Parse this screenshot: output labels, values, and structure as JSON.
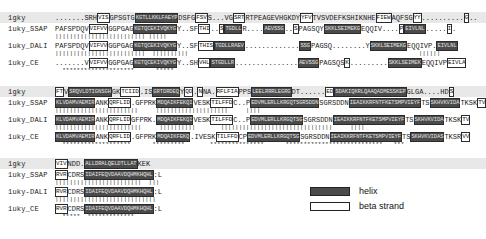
{
  "legend": {
    "items": [
      {
        "key": "helix",
        "label": "helix",
        "color": "#4a4a4a",
        "style": "filled-box"
      },
      {
        "key": "beta-strand",
        "label": "beta strand",
        "color": "#ffffff",
        "style": "outlined-box"
      }
    ]
  },
  "labels": {
    "query": "1gky",
    "ssap": "1uky_SSAP",
    "dali": "1uky_DALI",
    "dali_block3": "1uky-DALI",
    "ce": "1uky_CE"
  },
  "blocks": [
    {
      "id": "block-1",
      "rows": [
        {
          "name": "query-row",
          "label": "1gky",
          "highlight": true,
          "segments": [
            {
              "type": "plain",
              "text": ".......SRH"
            },
            {
              "type": "strand",
              "text": "VIS"
            },
            {
              "type": "plain",
              "text": "GPSGTG"
            },
            {
              "type": "helix",
              "text": "KGTLLKKLFAEYP"
            },
            {
              "type": "plain",
              "text": "DSFG"
            },
            {
              "type": "strand",
              "text": "FSV"
            },
            {
              "type": "plain",
              "text": "S...VG"
            },
            {
              "type": "strand",
              "text": "SRT"
            },
            {
              "type": "plain",
              "text": "RTPEAGEVHGKDY"
            },
            {
              "type": "strand",
              "text": "YFV"
            },
            {
              "type": "plain",
              "text": "TVSVDEFKSHIKNHE"
            },
            {
              "type": "strand",
              "text": "FIEW"
            },
            {
              "type": "plain",
              "text": "AQFSG"
            },
            {
              "type": "strand",
              "text": "YY"
            },
            {
              "type": "plain",
              "text": ".........."
            },
            {
              "type": "strand",
              "text": "G"
            },
            {
              "type": "plain",
              "text": ".."
            }
          ]
        },
        {
          "name": "ssap-row",
          "label": "1uky_SSAP",
          "highlight": false,
          "segments": [
            {
              "type": "plain",
              "text": "PAFSPDQV"
            },
            {
              "type": "strand",
              "text": "VIFVV"
            },
            {
              "type": "plain",
              "text": "GGPGAG"
            },
            {
              "type": "helix",
              "text": "KGTQCEKIVQKYG"
            },
            {
              "type": "plain",
              "text": "Y..SF"
            },
            {
              "type": "strand",
              "text": "THI"
            },
            {
              "type": "plain",
              "text": ".."
            },
            {
              "type": "strand",
              "text": "S"
            },
            {
              "type": "helix",
              "text": "TGDLL"
            },
            {
              "type": "plain",
              "text": "R...."
            },
            {
              "type": "helix",
              "text": "AEVSSG"
            },
            {
              "type": "plain",
              "text": ".."
            },
            {
              "type": "strand",
              "text": "S"
            },
            {
              "type": "plain",
              "text": "PAGSQY"
            },
            {
              "type": "helix",
              "text": "SKKLSEIMEKG"
            },
            {
              "type": "plain",
              "text": "EQQIV...."
            },
            {
              "type": "strand",
              "text": "P"
            },
            {
              "type": "helix",
              "text": "EIVLNL"
            },
            {
              "type": "plain",
              "text": "....."
            },
            {
              "type": "strand",
              "text": "I"
            },
            {
              "type": "plain",
              "text": "."
            }
          ]
        },
        {
          "name": "ssap-dali-marker",
          "marker": "||||||||||||||||||||||||| |||||"
        },
        {
          "name": "dali-row",
          "label": "1uky_DALI",
          "highlight": false,
          "segments": [
            {
              "type": "plain",
              "text": "PAFSPDQV"
            },
            {
              "type": "strand",
              "text": "VIFVV"
            },
            {
              "type": "plain",
              "text": "GGPGAG"
            },
            {
              "type": "helix",
              "text": "KGTQCEKIVQKYG"
            },
            {
              "type": "plain",
              "text": "Y..SF"
            },
            {
              "type": "strand",
              "text": "THIS"
            },
            {
              "type": "helix",
              "text": "TGDLLRAEV"
            },
            {
              "type": "plain",
              "text": "............."
            },
            {
              "type": "helix",
              "text": "SSG"
            },
            {
              "type": "plain",
              "text": "PAGSQ........Y"
            },
            {
              "type": "helix",
              "text": "SKKLSEIMEKG"
            },
            {
              "type": "plain",
              "text": "EQQIVP."
            },
            {
              "type": "helix",
              "text": "EIVLNL"
            }
          ]
        },
        {
          "name": "dali-ce-marker",
          "marker": "|||||||||||||||||||||||||  ||||||||||                                                                ||||||"
        },
        {
          "name": "ce-row",
          "label": "1uky_CE",
          "highlight": false,
          "segments": [
            {
              "type": "plain",
              "text": ".......V"
            },
            {
              "type": "strand",
              "text": "VIFVV"
            },
            {
              "type": "plain",
              "text": "GGPGAG"
            },
            {
              "type": "helix",
              "text": "KGTQCEKIVQKYG"
            },
            {
              "type": "plain",
              "text": "Y..SH"
            },
            {
              "type": "strand",
              "text": "VHL"
            },
            {
              "type": "helix",
              "text": "STGDLLR"
            },
            {
              "type": "plain",
              "text": "..............."
            },
            {
              "type": "helix",
              "text": "AEVSSG"
            },
            {
              "type": "plain",
              "text": "PAGSQS"
            },
            {
              "type": "strand",
              "text": "K"
            },
            {
              "type": "plain",
              "text": "........."
            },
            {
              "type": "helix",
              "text": "SKKLSEIMEK"
            },
            {
              "type": "plain",
              "text": "EQQIVP"
            },
            {
              "type": "strand",
              "text": "EIVLA"
            }
          ]
        },
        {
          "name": "consensus-stars",
          "stars": "  ********************      *****"
        }
      ]
    },
    {
      "id": "block-2",
      "rows": [
        {
          "name": "query-row",
          "label": "1gky",
          "highlight": true,
          "segments": [
            {
              "type": "strand",
              "text": "FT"
            },
            {
              "type": "plain",
              "text": "V"
            },
            {
              "type": "helix",
              "text": "SRQVLDTIGNSGH"
            },
            {
              "type": "plain",
              "text": "GK"
            },
            {
              "type": "strand",
              "text": "TCIID"
            },
            {
              "type": "plain",
              "text": ".IS"
            },
            {
              "type": "helix",
              "text": "GRTDRDEQ"
            },
            {
              "type": "plain",
              "text": "Y"
            },
            {
              "type": "strand",
              "text": "QD"
            },
            {
              "type": "plain",
              "text": "."
            },
            {
              "type": "strand",
              "text": "N"
            },
            {
              "type": "plain",
              "text": "NA."
            },
            {
              "type": "strand",
              "text": "RFLFIA"
            },
            {
              "type": "plain",
              "text": "PPS"
            },
            {
              "type": "helix",
              "text": "LEELRRRLEGRG"
            },
            {
              "type": "plain",
              "text": "DT......"
            },
            {
              "type": "strand",
              "text": "ED"
            },
            {
              "type": "helix",
              "text": "SDAKIQKRLQAAQADMESSKEP"
            },
            {
              "type": "plain",
              "text": "GLGA....HD"
            },
            {
              "type": "strand",
              "text": "S"
            }
          ]
        },
        {
          "name": "ssap-row",
          "label": "1uky_SSAP",
          "highlight": false,
          "segments": [
            {
              "type": "helix",
              "text": "KLVDAMVAEMIR"
            },
            {
              "type": "plain",
              "text": "ANK"
            },
            {
              "type": "strand",
              "text": "QRFLID"
            },
            {
              "type": "plain",
              "text": "."
            },
            {
              "type": "plain",
              "text": "GFPRK"
            },
            {
              "type": "helix",
              "text": "MDQAIKFEKQI"
            },
            {
              "type": "plain",
              "text": "VESK"
            },
            {
              "type": "strand",
              "text": "TILFFD"
            },
            {
              "type": "plain",
              "text": "C..P"
            },
            {
              "type": "helix",
              "text": "EDVMLERLLKRGQTSGRSDDN"
            },
            {
              "type": "plain",
              "text": "SGRSDDN"
            },
            {
              "type": "helix",
              "text": "IEAIKKRFNTFKETSMPVIEYF"
            },
            {
              "type": "plain",
              "text": "TS"
            },
            {
              "type": "helix",
              "text": "SKHVKVIDA"
            },
            {
              "type": "plain",
              "text": "TKSK"
            },
            {
              "type": "strand",
              "text": "TV"
            }
          ]
        },
        {
          "name": "ssap-dali-marker",
          "marker": "|||||||||||||||||||||||     ||||||||||||||||||||     ||||"
        },
        {
          "name": "dali-row",
          "label": "1uky_DALI",
          "highlight": false,
          "segments": [
            {
              "type": "helix",
              "text": "KLVDAMVAEMIR"
            },
            {
              "type": "plain",
              "text": "ANK"
            },
            {
              "type": "strand",
              "text": "QRFLID"
            },
            {
              "type": "plain",
              "text": "GFPRK."
            },
            {
              "type": "helix",
              "text": "MDQAIKFEKQI"
            },
            {
              "type": "plain",
              "text": "VESK"
            },
            {
              "type": "strand",
              "text": "TILFFD"
            },
            {
              "type": "plain",
              "text": "C..P"
            },
            {
              "type": "helix",
              "text": "EDVMLERLLKRGQTSG"
            },
            {
              "type": "plain",
              "text": "SGRSDDN"
            },
            {
              "type": "helix",
              "text": "IEAIKKRFNTFKETSMPVIEYF"
            },
            {
              "type": "plain",
              "text": "TS"
            },
            {
              "type": "helix",
              "text": "SKHVKVIDA"
            },
            {
              "type": "plain",
              "text": "TKSK"
            },
            {
              "type": "strand",
              "text": "TV"
            }
          ]
        },
        {
          "name": "dali-ce-marker",
          "marker": "||||||||||||||||||||||||     ||||||||||       |||||||||||||||||||||||||||||||     ||||"
        },
        {
          "name": "ce-row",
          "label": "1uky_CE",
          "highlight": false,
          "segments": [
            {
              "type": "helix",
              "text": "KLVDAMVAEMIR"
            },
            {
              "type": "plain",
              "text": "ANK"
            },
            {
              "type": "strand",
              "text": "QRFLID"
            },
            {
              "type": "plain",
              "text": ".GFPRK"
            },
            {
              "type": "helix",
              "text": "MDQAIKFEKQ"
            },
            {
              "type": "plain",
              "text": ".IVESK"
            },
            {
              "type": "strand",
              "text": "TILFFD"
            },
            {
              "type": "plain",
              "text": "CP"
            },
            {
              "type": "helix",
              "text": "EDVMLERLLKRGQTSG"
            },
            {
              "type": "plain",
              "text": "SGRSDDN"
            },
            {
              "type": "helix",
              "text": "IEAIKKRFNTFKETSMPVIEYF"
            },
            {
              "type": "plain",
              "text": "TS"
            },
            {
              "type": "helix",
              "text": "SKHVKVIDAS"
            },
            {
              "type": "plain",
              "text": "TKSR"
            },
            {
              "type": "strand",
              "text": "VV"
            }
          ]
        },
        {
          "name": "consensus-stars",
          "stars": "  *******************      *********       ***************      ***************************   ***"
        }
      ]
    },
    {
      "id": "block-3",
      "rows": [
        {
          "name": "query-row",
          "label": "1gky",
          "highlight": true,
          "segments": [
            {
              "type": "strand",
              "text": "VIV"
            },
            {
              "type": "plain",
              "text": "NDD."
            },
            {
              "type": "helix",
              "text": "ALLDRALQELDTLLAT"
            },
            {
              "type": "plain",
              "text": "KEK"
            }
          ]
        },
        {
          "name": "ssap-row",
          "label": "1uky_SSAP",
          "highlight": false,
          "segments": [
            {
              "type": "strand",
              "text": "RVR"
            },
            {
              "type": "plain",
              "text": "CDRS"
            },
            {
              "type": "helix",
              "text": "IDAIFEQVDAAVDQHMKHQHL"
            },
            {
              "type": "plain",
              "text": ":L"
            }
          ]
        },
        {
          "name": "ssap-dali-marker",
          "marker": "||||||||||||||||||||||||  |||"
        },
        {
          "name": "dali-row",
          "label": "1uky-DALI",
          "highlight": false,
          "segments": [
            {
              "type": "strand",
              "text": "RVR"
            },
            {
              "type": "plain",
              "text": "CDRS"
            },
            {
              "type": "helix",
              "text": "IDAIFEQVDAAVDQHMKHQHL"
            },
            {
              "type": "plain",
              "text": ":L"
            }
          ]
        },
        {
          "name": "dali-ce-marker",
          "marker": "||||||||||||||||||||||||||||"
        },
        {
          "name": "ce-row",
          "label": "1uky_CE",
          "highlight": false,
          "segments": [
            {
              "type": "strand",
              "text": "RVR"
            },
            {
              "type": "plain",
              "text": "CDRS"
            },
            {
              "type": "helix",
              "text": "IDAIFEQVDAAVDQHMKHQHL"
            },
            {
              "type": "plain",
              "text": ":L"
            }
          ]
        },
        {
          "name": "consensus-stars",
          "stars": "  *****  *************"
        }
      ]
    }
  ]
}
